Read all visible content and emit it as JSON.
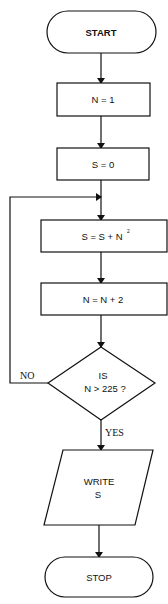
{
  "diagram": {
    "type": "flowchart",
    "nodes": [
      {
        "id": "start",
        "shape": "terminal",
        "label": "START"
      },
      {
        "id": "init_n",
        "shape": "process",
        "label": "N = 1"
      },
      {
        "id": "init_s",
        "shape": "process",
        "label": "S = 0"
      },
      {
        "id": "accumulate",
        "shape": "process",
        "label": "S = S + N",
        "superscript": "2"
      },
      {
        "id": "increment",
        "shape": "process",
        "label": "N = N + 2"
      },
      {
        "id": "decision",
        "shape": "decision",
        "label_line1": "IS",
        "label_line2": "N > 225 ?"
      },
      {
        "id": "output",
        "shape": "io",
        "label_line1": "WRITE",
        "label_line2": "S"
      },
      {
        "id": "stop",
        "shape": "terminal",
        "label": "STOP"
      }
    ],
    "edges": {
      "no_label": "NO",
      "yes_label": "YES"
    }
  }
}
